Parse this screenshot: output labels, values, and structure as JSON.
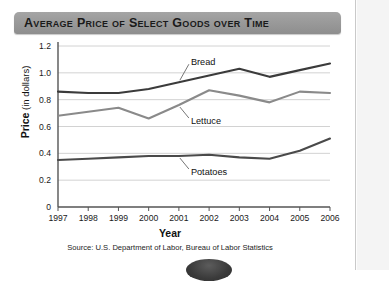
{
  "banner": {
    "title": "Average Price of Select Goods over Time"
  },
  "axes": {
    "y_title_bold": "Price",
    "y_title_rest": " (in dollars)",
    "x_title": "Year"
  },
  "source": "Source:  U.S. Department of Labor, Bureau of Labor Statistics",
  "colors": {
    "banner": "#9a9a9a",
    "bread": "#3b3b3b",
    "lettuce": "#8a8a8a",
    "potatoes": "#4a4a4a",
    "gridline": "#d2d2d2",
    "axis": "#555555"
  },
  "chart_data": {
    "type": "line",
    "title": "Average Price of Select Goods over Time",
    "xlabel": "Year",
    "ylabel": "Price (in dollars)",
    "x": [
      1997,
      1998,
      1999,
      2000,
      2001,
      2002,
      2003,
      2004,
      2005,
      2006
    ],
    "xtick_labels": [
      "1997",
      "1998",
      "1999",
      "2000",
      "2001",
      "2002",
      "2003",
      "2004",
      "2005",
      "2006"
    ],
    "ylim": [
      0,
      1.2
    ],
    "ytick_labels": [
      "0",
      "0.2",
      "0.4",
      "0.6",
      "0.8",
      "1.0",
      "1.2"
    ],
    "ytick_values": [
      0,
      0.2,
      0.4,
      0.6,
      0.8,
      1.0,
      1.2
    ],
    "grid": "horizontal",
    "legend": "inline-labels",
    "series": [
      {
        "name": "Bread",
        "color": "#3b3b3b",
        "values": [
          0.86,
          0.85,
          0.85,
          0.88,
          0.93,
          0.98,
          1.03,
          0.97,
          1.02,
          1.07
        ]
      },
      {
        "name": "Lettuce",
        "color": "#8a8a8a",
        "values": [
          0.68,
          0.71,
          0.74,
          0.66,
          0.76,
          0.87,
          0.83,
          0.78,
          0.86,
          0.85
        ]
      },
      {
        "name": "Potatoes",
        "color": "#4a4a4a",
        "values": [
          0.35,
          0.36,
          0.37,
          0.38,
          0.38,
          0.39,
          0.37,
          0.36,
          0.42,
          0.51
        ]
      }
    ],
    "annotations": [
      {
        "text": "Bread",
        "series": "Bread",
        "anchor_x": 2001
      },
      {
        "text": "Lettuce",
        "series": "Lettuce",
        "anchor_x": 2001
      },
      {
        "text": "Potatoes",
        "series": "Potatoes",
        "anchor_x": 2001
      }
    ]
  }
}
